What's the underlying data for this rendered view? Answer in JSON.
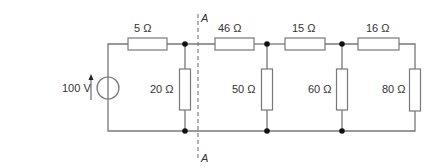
{
  "diagram": {
    "type": "circuit",
    "source": {
      "label": "100 V"
    },
    "resistors": [
      {
        "id": "r5",
        "label": "5 Ω"
      },
      {
        "id": "r20",
        "label": "20 Ω"
      },
      {
        "id": "r46",
        "label": "46 Ω"
      },
      {
        "id": "r50",
        "label": "50 Ω"
      },
      {
        "id": "r15",
        "label": "15 Ω"
      },
      {
        "id": "r60",
        "label": "60 Ω"
      },
      {
        "id": "r16",
        "label": "16 Ω"
      },
      {
        "id": "r80",
        "label": "80 Ω"
      }
    ],
    "section_line": {
      "top_label": "A",
      "bottom_label": "A"
    }
  }
}
